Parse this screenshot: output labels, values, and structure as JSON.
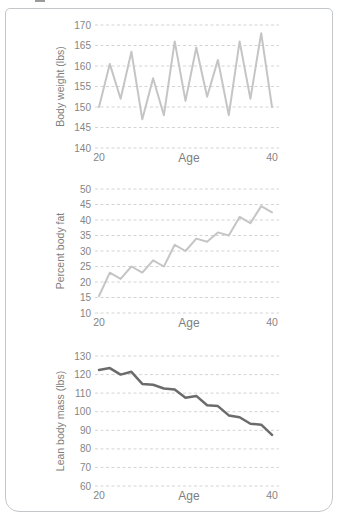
{
  "figure": {
    "border_color": "#c3c7c9"
  },
  "chart_data": [
    {
      "type": "line",
      "name": "body-weight",
      "ylabel": "Body weight (lbs)",
      "xlabel": "Age",
      "xlim": [
        20,
        40
      ],
      "xticks": [
        20,
        40
      ],
      "ylim": [
        140,
        170
      ],
      "yticks": [
        170,
        165,
        160,
        155,
        150,
        145,
        140
      ],
      "grid": "horizontal dashed",
      "legend": "none",
      "line_color": "#c5c5c5",
      "line_width": 2,
      "x": [
        20,
        21.25,
        22.5,
        23.75,
        25,
        26.25,
        27.5,
        28.75,
        30,
        31.25,
        32.5,
        33.75,
        35,
        36.25,
        37.5,
        38.75,
        40
      ],
      "y": [
        150,
        160.5,
        152,
        163.5,
        147,
        157,
        148,
        166,
        151.5,
        164.5,
        152.5,
        161.5,
        148,
        166,
        152,
        168,
        150
      ]
    },
    {
      "type": "line",
      "name": "percent-body-fat",
      "ylabel": "Percent body fat",
      "xlabel": "Age",
      "xlim": [
        20,
        40
      ],
      "xticks": [
        20,
        40
      ],
      "ylim": [
        10,
        50
      ],
      "yticks": [
        50,
        45,
        40,
        35,
        30,
        25,
        20,
        15,
        10
      ],
      "grid": "horizontal dashed",
      "legend": "none",
      "line_color": "#c5c5c5",
      "line_width": 2,
      "x": [
        20,
        21.25,
        22.5,
        23.75,
        25,
        26.25,
        27.5,
        28.75,
        30,
        31.25,
        32.5,
        33.75,
        35,
        36.25,
        37.5,
        38.75,
        40
      ],
      "y": [
        15.5,
        23,
        21,
        25,
        23,
        27,
        25,
        32,
        30,
        34,
        33,
        36,
        35,
        41,
        39,
        44.5,
        42.5
      ]
    },
    {
      "type": "line",
      "name": "lean-body-mass",
      "ylabel": "Lean body mass (lbs)",
      "xlabel": "Age",
      "xlim": [
        20,
        40
      ],
      "xticks": [
        20,
        40
      ],
      "ylim": [
        60,
        130
      ],
      "yticks": [
        130,
        120,
        110,
        100,
        90,
        80,
        70,
        60
      ],
      "grid": "horizontal dashed",
      "legend": "none",
      "line_color": "#6b6b6b",
      "line_width": 2.5,
      "x": [
        20,
        21.25,
        22.5,
        23.75,
        25,
        26.25,
        27.5,
        28.75,
        30,
        31.25,
        32.5,
        33.75,
        35,
        36.25,
        37.5,
        38.75,
        40
      ],
      "y": [
        122.5,
        123.5,
        120,
        121.5,
        115,
        114.5,
        112.5,
        112,
        107.5,
        108.5,
        103.5,
        103,
        98,
        97,
        93.5,
        93,
        87.5
      ]
    }
  ]
}
